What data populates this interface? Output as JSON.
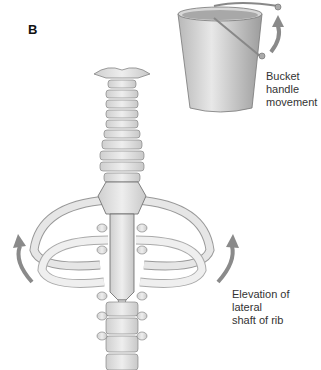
{
  "figure": {
    "panel_label": "B",
    "bucket_label": [
      "Bucket",
      "handle",
      "movement"
    ],
    "rib_label": [
      "Elevation of lateral",
      "shaft of rib"
    ]
  },
  "colors": {
    "bone": "#e4e4e4",
    "bone_shade": "#bdbdbd",
    "outline": "#555555",
    "arrow": "#8a8a8a",
    "bucket": "#d0d0d0"
  },
  "diagram": {
    "components": [
      "bucket",
      "bucket-handle",
      "cervical-spine",
      "thoracic-spine",
      "sternum",
      "ribs",
      "movement-arrows"
    ]
  }
}
